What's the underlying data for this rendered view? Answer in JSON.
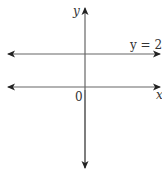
{
  "diagram": {
    "axes": {
      "x_label": "x",
      "y_label": "y",
      "origin_label": "0"
    },
    "line": {
      "equation_label": "y = 2",
      "y_value": 2
    },
    "colors": {
      "stroke": "#555555",
      "text": "#333333"
    }
  }
}
